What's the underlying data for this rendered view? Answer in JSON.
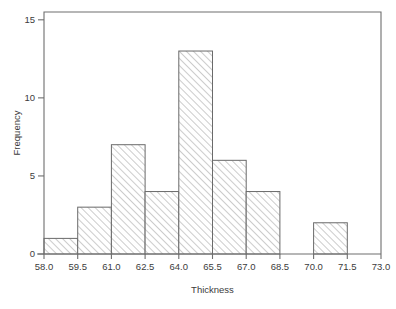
{
  "chart_data": {
    "type": "bar",
    "title": "",
    "subtitle": "",
    "xlabel": "Thickness",
    "ylabel": "Frequency",
    "xlim": [
      58.0,
      73.0
    ],
    "ylim": [
      0,
      15.5
    ],
    "grid": false,
    "legend": null,
    "bin_width": 1.5,
    "bin_edges": [
      58.0,
      59.5,
      61.0,
      62.5,
      64.0,
      65.5,
      67.0,
      68.5,
      70.0,
      71.5,
      73.0
    ],
    "categories": [
      "58.0-59.5",
      "59.5-61.0",
      "61.0-62.5",
      "62.5-64.0",
      "64.0-65.5",
      "65.5-67.0",
      "67.0-68.5",
      "68.5-70.0",
      "70.0-71.5",
      "71.5-73.0"
    ],
    "values": [
      1,
      3,
      7,
      4,
      13,
      6,
      4,
      0,
      2,
      0
    ],
    "x_ticks": [
      58.0,
      59.5,
      61.0,
      62.5,
      64.0,
      65.5,
      67.0,
      68.5,
      70.0,
      71.5,
      73.0
    ],
    "x_tick_labels": [
      "58.0",
      "59.5",
      "61.0",
      "62.5",
      "64.0",
      "65.5",
      "67.0",
      "68.5",
      "70.0",
      "71.5",
      "73.0"
    ],
    "y_ticks": [
      0,
      5,
      10,
      15
    ],
    "y_tick_labels": [
      "0",
      "5",
      "10",
      "15"
    ],
    "bar_fill": "hatch-diagonal-45",
    "bar_edge_color": "#6a6a6a",
    "axis_color": "#6e6e6e",
    "text_color": "#3c3c3c",
    "background_color": "#ffffff",
    "total_count": 40
  },
  "axes": {
    "x_title": "Thickness",
    "y_title": "Frequency"
  }
}
